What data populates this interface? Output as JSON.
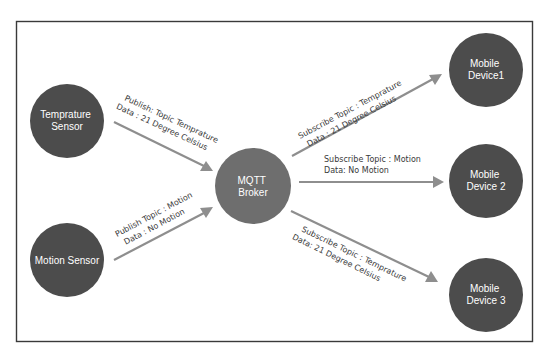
{
  "diagram": {
    "colors": {
      "node": "#4c4c4c",
      "broker": "#6e6e6e",
      "arrow": "#8e8e8e",
      "text_on_node": "#ffffff",
      "edge_text": "#3a3a3a",
      "frame": "#3a3a3a"
    },
    "nodes": [
      {
        "id": "temp-sensor",
        "role": "publisher",
        "lines": [
          "Temprature",
          "Sensor"
        ]
      },
      {
        "id": "motion-sensor",
        "role": "publisher",
        "lines": [
          "Motion Sensor"
        ]
      },
      {
        "id": "broker",
        "role": "broker",
        "lines": [
          "MQTT",
          "Broker"
        ]
      },
      {
        "id": "mobile-1",
        "role": "subscriber",
        "lines": [
          "Mobile",
          "Device1"
        ]
      },
      {
        "id": "mobile-2",
        "role": "subscriber",
        "lines": [
          "Mobile",
          "Device 2"
        ]
      },
      {
        "id": "mobile-3",
        "role": "subscriber",
        "lines": [
          "Mobile",
          "Device 3"
        ]
      }
    ],
    "edges": [
      {
        "from": "temp-sensor",
        "to": "broker",
        "lines": [
          "Publish: Topic Temprature",
          "Data : 21 Degree Celsius"
        ]
      },
      {
        "from": "motion-sensor",
        "to": "broker",
        "lines": [
          "Publish Topic : Motion",
          "Data : No Motion"
        ]
      },
      {
        "from": "broker",
        "to": "mobile-1",
        "lines": [
          "Subscribe Topic : Temprature",
          "Data : 21 Degree Celsius"
        ]
      },
      {
        "from": "broker",
        "to": "mobile-2",
        "lines": [
          "Subscribe Topic : Motion",
          "Data: No Motion"
        ]
      },
      {
        "from": "broker",
        "to": "mobile-3",
        "lines": [
          "Subscribe Topic : Temprature",
          "Data: 21 Degree Celsius"
        ]
      }
    ]
  }
}
